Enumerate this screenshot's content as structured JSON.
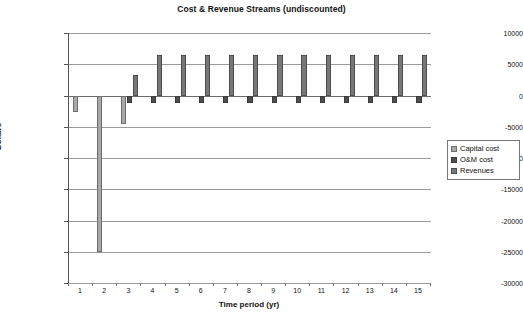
{
  "chart_data": {
    "type": "bar",
    "title": "Cost & Revenue Streams (undiscounted)",
    "xlabel": "Time period (yr)",
    "ylabel": "Dollars",
    "categories": [
      1,
      2,
      3,
      4,
      5,
      6,
      7,
      8,
      9,
      10,
      11,
      12,
      13,
      14,
      15
    ],
    "ylim": [
      -30000,
      10000
    ],
    "ytick_labels": [
      "10000",
      "5000",
      "0",
      "-5000",
      "-10000",
      "-15000",
      "-20000",
      "-25000",
      "-30000"
    ],
    "ytick_values": [
      10000,
      5000,
      0,
      -5000,
      -10000,
      -15000,
      -20000,
      -25000,
      -30000
    ],
    "grid": true,
    "legend_position": "right",
    "series": [
      {
        "name": "Capital cost",
        "color": "#a8a8a8",
        "values": [
          -2700,
          -25000,
          -4500,
          0,
          0,
          0,
          0,
          0,
          0,
          0,
          0,
          0,
          0,
          0,
          0
        ]
      },
      {
        "name": "O&M cost",
        "color": "#4e4e4e",
        "values": [
          0,
          0,
          -1200,
          -1200,
          -1200,
          -1200,
          -1200,
          -1200,
          -1200,
          -1200,
          -1200,
          -1200,
          -1200,
          -1200,
          -1200
        ]
      },
      {
        "name": "Revenues",
        "color": "#777777",
        "values": [
          0,
          0,
          3300,
          6500,
          6500,
          6500,
          6500,
          6500,
          6500,
          6500,
          6500,
          6500,
          6500,
          6500,
          6500
        ]
      }
    ]
  }
}
